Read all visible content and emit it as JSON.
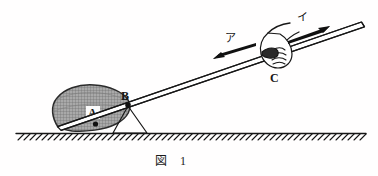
{
  "figure": {
    "caption_label": "図",
    "caption_number": "1",
    "background_color": "#fffefe",
    "ink_color": "#171717",
    "rock_fill_color": "#a9a9a9",
    "rock_hatch_color": "#6e6e6e"
  },
  "labels": {
    "point_a": "A",
    "point_b": "B",
    "point_c": "C",
    "arrow_down_left": "ア",
    "arrow_up_right": "イ"
  },
  "elements": {
    "rock_name": "rock",
    "rod_name": "lever-rod",
    "fulcrum_name": "fulcrum-wedge",
    "hand_name": "hand-grip",
    "ground_name": "ground-line"
  },
  "diagram_data": {
    "type": "physics-lever-schematic",
    "rod_start": [
      57,
      126
    ],
    "rod_end": [
      362,
      22
    ],
    "fulcrum_point": [
      128,
      105
    ],
    "load_point": [
      96,
      124
    ],
    "grip_point": [
      268,
      57
    ],
    "ground_y": 133,
    "arrow_a_direction": "down-left",
    "arrow_i_direction": "up-right"
  }
}
